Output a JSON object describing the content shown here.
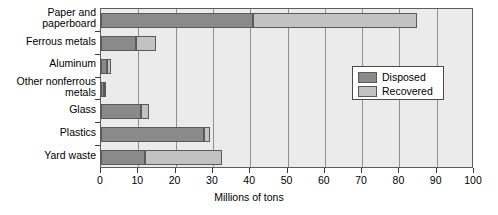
{
  "chart_data": {
    "type": "bar",
    "orientation": "horizontal",
    "stacked": true,
    "title": "",
    "xlabel": "Millions of tons",
    "ylabel": "",
    "xlim": [
      0,
      100
    ],
    "xticks": [
      0,
      10,
      20,
      30,
      40,
      50,
      60,
      70,
      80,
      90,
      100
    ],
    "xtick_labels": [
      "0",
      "10",
      "20",
      "30",
      "40",
      "50",
      "60",
      "70",
      "80",
      "90",
      "100"
    ],
    "grid": "vertical",
    "legend_position": "center-right",
    "categories": [
      "Paper and\npaperboard",
      "Ferrous metals",
      "Aluminum",
      "Other nonferrous\nmetals",
      "Glass",
      "Plastics",
      "Yard waste"
    ],
    "series": [
      {
        "name": "Disposed",
        "color": "#8a8a8a",
        "values": [
          40.8,
          9.4,
          1.6,
          0.7,
          10.7,
          27.6,
          11.8
        ]
      },
      {
        "name": "Recovered",
        "color": "#c2c2c2",
        "values": [
          43.9,
          5.3,
          1.1,
          0.3,
          2.2,
          1.6,
          20.6
        ]
      }
    ],
    "totals": [
      84.7,
      14.7,
      2.7,
      1.0,
      12.9,
      29.2,
      32.4
    ]
  },
  "legend": {
    "items": [
      {
        "label": "Disposed"
      },
      {
        "label": "Recovered"
      }
    ]
  },
  "colors": {
    "disposed": "#8a8a8a",
    "recovered": "#c2c2c2",
    "plot_background": "#ebebeb",
    "axis": "#5d5d5d",
    "gridline": "#8f8f8f"
  }
}
